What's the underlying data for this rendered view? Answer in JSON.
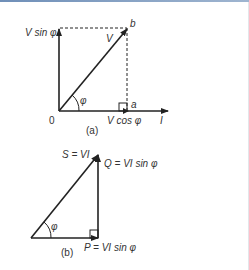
{
  "diagram_a": {
    "caption": "(a)",
    "origin_label": "0",
    "vertical_label": "V sin φ",
    "diagonal_label": "V",
    "point_b_label": "b",
    "point_a_label": "a",
    "horizontal_component_label": "V cos φ",
    "current_label": "I",
    "angle_label": "φ"
  },
  "diagram_b": {
    "caption": "(b)",
    "hypotenuse_label": "S = VI",
    "vertical_label": "Q = VI sin φ",
    "horizontal_label": "P = VI sin φ",
    "angle_label": "φ"
  },
  "colors": {
    "line": "#222222",
    "text": "#333333",
    "top_border": "#7a96bb"
  }
}
